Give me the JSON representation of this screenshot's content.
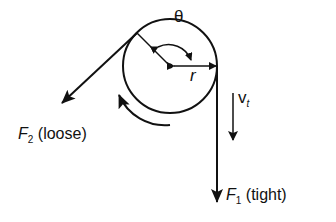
{
  "diagram": {
    "labels": {
      "theta": "θ",
      "radius": "r",
      "velocity_symbol": "v",
      "velocity_sub": "t",
      "f2_symbol": "F",
      "f2_sub": "2",
      "f2_desc": "(loose)",
      "f1_symbol": "F",
      "f1_sub": "1",
      "f1_desc": "(tight)"
    },
    "colors": {
      "stroke": "#111111",
      "background": "#ffffff"
    }
  }
}
